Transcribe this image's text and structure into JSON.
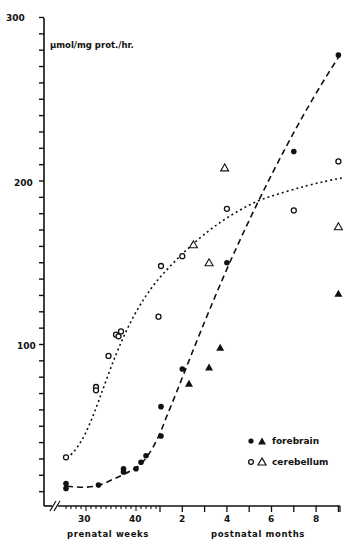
{
  "chart_data": {
    "type": "scatter",
    "title": "",
    "ylabel": "µmol/mg prot./hr.",
    "xlabel_prenatal": "prenatal weeks",
    "xlabel_postnatal": "postnatal months",
    "ylim": [
      0,
      300
    ],
    "yticks_labeled": [
      100,
      200,
      300
    ],
    "ytick_minor_step": 10,
    "x_prenatal_ticks": [
      "30",
      "40"
    ],
    "x_postnatal_ticks": [
      "2",
      "4",
      "6",
      "8"
    ],
    "grid": false,
    "legend_position": "lower right",
    "x_axis_note": "x axis broken (//) at start; prenatal weeks 26-44, then postnatal months 0-8.5",
    "series": [
      {
        "name": "forebrain",
        "marker": "filled-circle",
        "points": [
          {
            "x": "26 wk",
            "y": 15
          },
          {
            "x": "26 wk",
            "y": 12
          },
          {
            "x": "32.5 wk",
            "y": 14
          },
          {
            "x": "37.5 wk",
            "y": 24
          },
          {
            "x": "37.5 wk",
            "y": 22
          },
          {
            "x": "40 wk",
            "y": 24
          },
          {
            "x": "41 wk",
            "y": 28
          },
          {
            "x": "42 wk",
            "y": 32
          },
          {
            "x": "45 wk",
            "y": 44
          },
          {
            "x": "45 wk",
            "y": 62
          },
          {
            "x": "1 mo",
            "y": 85
          },
          {
            "x": "3 mo",
            "y": 150
          },
          {
            "x": "6 mo",
            "y": 218
          },
          {
            "x": "8 mo",
            "y": 277
          }
        ]
      },
      {
        "name": "forebrain",
        "marker": "filled-triangle",
        "points": [
          {
            "x": "1.3 mo",
            "y": 76
          },
          {
            "x": "2.2 mo",
            "y": 86
          },
          {
            "x": "2.7 mo",
            "y": 98
          },
          {
            "x": "8 mo",
            "y": 131
          }
        ]
      },
      {
        "name": "cerebellum",
        "marker": "open-circle",
        "points": [
          {
            "x": "26 wk",
            "y": 31
          },
          {
            "x": "32 wk",
            "y": 74
          },
          {
            "x": "32 wk",
            "y": 72
          },
          {
            "x": "34.5 wk",
            "y": 93
          },
          {
            "x": "36 wk",
            "y": 106
          },
          {
            "x": "36.5 wk",
            "y": 105
          },
          {
            "x": "37 wk",
            "y": 108
          },
          {
            "x": "44.5 wk",
            "y": 117
          },
          {
            "x": "45 wk",
            "y": 148
          },
          {
            "x": "1 mo",
            "y": 154
          },
          {
            "x": "3 mo",
            "y": 183
          },
          {
            "x": "6 mo",
            "y": 182
          },
          {
            "x": "8 mo",
            "y": 212
          }
        ]
      },
      {
        "name": "cerebellum",
        "marker": "open-triangle",
        "points": [
          {
            "x": "1.5 mo",
            "y": 161
          },
          {
            "x": "2.2 mo",
            "y": 150
          },
          {
            "x": "2.9 mo",
            "y": 208
          },
          {
            "x": "8 mo",
            "y": 172
          }
        ]
      }
    ],
    "fit_curves": [
      {
        "name": "forebrain",
        "style": "dashed",
        "shape": "sigmoid rising, from ~14 at 26 wk to ~277 at 8 mo"
      },
      {
        "name": "cerebellum",
        "style": "dotted",
        "shape": "sigmoid saturating, from ~31 at 26 wk to ~202 at 8.5 mo"
      }
    ]
  },
  "legend": {
    "forebrain": "forebrain",
    "cerebellum": "cerebellum"
  }
}
